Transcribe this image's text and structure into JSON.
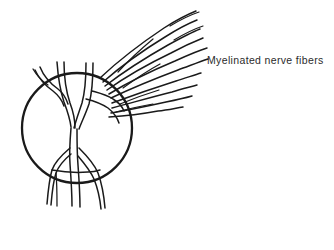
{
  "figure": {
    "name": "optic-disc-myelinated-nerve-fibers",
    "background_color": "#ffffff",
    "ink_color": "#1a1a1a",
    "annotations": [
      {
        "id": "myelinated-nerve-fibers",
        "text": "Myelinated nerve fibers",
        "x": 207,
        "y": 54,
        "font_size_px": 10.5,
        "color": "#2b2b2b"
      }
    ],
    "shapes": {
      "optic_disc": {
        "type": "circle",
        "label": "optic-disc",
        "cx": 77,
        "cy": 128,
        "r": 55,
        "stroke_width": 2.3
      },
      "retinal_vessels": [
        {
          "name": "vessel-upper-left-branch-outer",
          "d": "M 35 70 C 39 79 46 86 53 91 C 58 95 62 100 64 106"
        },
        {
          "name": "vessel-upper-left-branch-inner",
          "d": "M 40 67 C 44 77 51 84 58 89 C 63 93 66 98 68 104"
        },
        {
          "name": "vessel-upper-left-stub",
          "d": "M 33 69 C 37 76 42 81 48 85"
        },
        {
          "name": "vessel-superior-trunk-left",
          "d": "M 57 62 C 58 76 60 90 64 102 C 67 110 70 118 71 127"
        },
        {
          "name": "vessel-superior-trunk-right",
          "d": "M 64 62 C 64 77 66 91 70 103 C 73 111 75 119 75 128"
        },
        {
          "name": "vessel-superior-right-branch-left",
          "d": "M 86 63 C 86 78 85 92 82 103 C 79 112 76 120 74 128"
        },
        {
          "name": "vessel-superior-right-branch-right",
          "d": "M 93 63 C 93 79 92 93 89 104 C 86 113 82 121 79 129"
        },
        {
          "name": "vessel-temporal-arch-upper",
          "d": "M 92 91 C 99 93 107 95 113 99 C 118 102 122 106 124 111"
        },
        {
          "name": "vessel-temporal-arch-lower",
          "d": "M 86 99 C 94 101 102 104 108 108 C 113 112 117 117 119 123"
        },
        {
          "name": "vessel-central-trunk-left",
          "d": "M 71 128 C 70 140 69 152 70 164 C 71 178 72 192 72 206"
        },
        {
          "name": "vessel-central-trunk-right",
          "d": "M 77 129 C 77 141 77 153 78 165 C 79 179 80 193 80 207"
        },
        {
          "name": "vessel-inferior-left-branch-outer",
          "d": "M 70 148 C 63 154 55 161 52 170 C 49 180 48 192 47 204"
        },
        {
          "name": "vessel-inferior-left-branch-inner",
          "d": "M 71 154 C 65 159 59 165 56 173 C 53 182 52 193 51 205"
        },
        {
          "name": "vessel-inferior-right-branch-outer",
          "d": "M 79 148 C 86 155 94 163 98 173 C 102 184 104 196 105 208"
        },
        {
          "name": "vessel-inferior-right-branch-inner",
          "d": "M 78 156 C 84 163 90 170 94 179 C 98 189 100 199 101 209"
        },
        {
          "name": "vessel-inferior-crossbar",
          "d": "M 52 170 C 63 172 76 173 88 172 C 93 172 97 171 100 170"
        },
        {
          "name": "vessel-inferior-left-tail",
          "d": "M 56 173 C 57 184 57 195 57 206"
        }
      ],
      "nerve_fibers": [
        {
          "name": "fiber-1",
          "d": "M 100 78 C 117 62 140 44 164 28 C 175 21 186 15 196 11"
        },
        {
          "name": "fiber-2",
          "d": "M 103 82 C 119 68 142 51 165 37 C 176 30 187 24 197 20"
        },
        {
          "name": "fiber-3",
          "d": "M 105 86 C 122 73 145 58 168 45 C 179 39 190 33 200 29"
        },
        {
          "name": "fiber-4",
          "d": "M 107 90 C 124 78 148 64 171 53 C 182 47 193 42 203 38"
        },
        {
          "name": "fiber-5",
          "d": "M 109 94 C 127 83 151 71 175 61 C 186 56 197 51 207 48"
        },
        {
          "name": "fiber-6",
          "d": "M 111 98 C 130 89 154 79 178 70 C 189 66 199 62 208 59"
        },
        {
          "name": "fiber-7",
          "d": "M 112 103 C 131 96 154 88 176 81 C 186 78 194 75 201 73"
        },
        {
          "name": "fiber-8",
          "d": "M 112 108 C 131 103 152 97 172 92 C 182 89 190 87 197 85"
        },
        {
          "name": "fiber-9",
          "d": "M 111 113 C 129 110 148 106 166 102 C 176 100 185 98 192 96"
        },
        {
          "name": "fiber-10",
          "d": "M 109 117 C 125 116 142 114 158 111 C 168 110 176 108 183 107"
        },
        {
          "name": "fiber-short-a",
          "d": "M 118 72 C 128 61 141 49 153 39"
        },
        {
          "name": "fiber-short-b",
          "d": "M 123 88 C 134 80 147 71 160 64"
        },
        {
          "name": "fiber-short-c",
          "d": "M 120 104 C 132 99 146 94 159 90"
        },
        {
          "name": "fiber-short-d",
          "d": "M 116 112 C 128 109 141 106 153 104"
        },
        {
          "name": "fiber-tip-a",
          "d": "M 170 26 C 180 20 190 15 199 12"
        },
        {
          "name": "fiber-tip-b",
          "d": "M 174 40 C 184 34 194 29 203 26"
        }
      ]
    }
  }
}
